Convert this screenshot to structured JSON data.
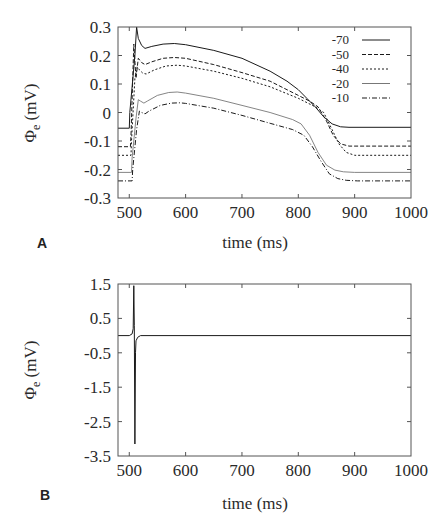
{
  "chart_data": [
    {
      "panel": "A",
      "type": "line",
      "title": "",
      "xlabel": "time (ms)",
      "ylabel": "Φe (mV)",
      "ylabel_main": "Φ",
      "ylabel_sub": "e",
      "ylabel_unit": " (mV)",
      "xlim": [
        480,
        1000
      ],
      "ylim": [
        -0.3,
        0.3
      ],
      "xticks": [
        500,
        600,
        700,
        800,
        900,
        1000
      ],
      "xtick_labels": [
        "500",
        "600",
        "700",
        "800",
        "900",
        "1000"
      ],
      "yticks": [
        0.3,
        0.2,
        0.1,
        0,
        -0.1,
        -0.2,
        -0.3
      ],
      "ytick_labels": [
        "0.3",
        "0.2",
        "0.1",
        "0",
        "-0.1",
        "-0.2",
        "-0.3"
      ],
      "grid": false,
      "legend_position": "upper right",
      "series": [
        {
          "name": "-70",
          "dash": "",
          "x": [
            480,
            500,
            501,
            510,
            513,
            516,
            522,
            528,
            540,
            560,
            580,
            600,
            650,
            700,
            750,
            780,
            800,
            815,
            830,
            845,
            860,
            875,
            890,
            1000
          ],
          "y": [
            -0.055,
            -0.055,
            0.0,
            0.2,
            0.3,
            0.26,
            0.235,
            0.225,
            0.232,
            0.24,
            0.242,
            0.238,
            0.218,
            0.19,
            0.145,
            0.11,
            0.08,
            0.05,
            0.02,
            -0.015,
            -0.04,
            -0.05,
            -0.052,
            -0.052
          ]
        },
        {
          "name": "-50",
          "dash": "4,2",
          "x": [
            480,
            502,
            503,
            508,
            512,
            516,
            522,
            528,
            540,
            560,
            580,
            600,
            650,
            700,
            750,
            800,
            820,
            835,
            850,
            862,
            875,
            890,
            1000
          ],
          "y": [
            -0.12,
            -0.12,
            -0.08,
            0.24,
            0.12,
            0.19,
            0.175,
            0.168,
            0.178,
            0.19,
            0.193,
            0.19,
            0.168,
            0.14,
            0.11,
            0.06,
            0.04,
            0.02,
            -0.03,
            -0.08,
            -0.11,
            -0.118,
            -0.118
          ]
        },
        {
          "name": "-40",
          "dash": "2,2",
          "x": [
            480,
            503,
            504,
            510,
            514,
            518,
            524,
            530,
            545,
            565,
            585,
            600,
            650,
            700,
            750,
            800,
            830,
            845,
            860,
            872,
            885,
            900,
            1000
          ],
          "y": [
            -0.15,
            -0.15,
            -0.1,
            0.12,
            0.16,
            0.15,
            0.138,
            0.135,
            0.15,
            0.163,
            0.166,
            0.163,
            0.145,
            0.12,
            0.09,
            0.05,
            0.02,
            0.0,
            -0.06,
            -0.11,
            -0.14,
            -0.15,
            -0.15
          ]
        },
        {
          "name": "-20",
          "dash": "",
          "thin": true,
          "x": [
            480,
            504,
            505,
            512,
            516,
            520,
            526,
            532,
            550,
            570,
            585,
            600,
            650,
            700,
            750,
            790,
            805,
            820,
            835,
            850,
            865,
            880,
            900,
            1000
          ],
          "y": [
            -0.21,
            -0.21,
            -0.16,
            -0.02,
            0.045,
            0.04,
            0.033,
            0.04,
            0.06,
            0.07,
            0.072,
            0.068,
            0.05,
            0.025,
            0.0,
            -0.025,
            -0.04,
            -0.08,
            -0.14,
            -0.185,
            -0.202,
            -0.208,
            -0.21,
            -0.21
          ]
        },
        {
          "name": "-10",
          "dash": "5,2,1,2",
          "x": [
            480,
            505,
            506,
            513,
            518,
            522,
            528,
            535,
            555,
            575,
            590,
            600,
            650,
            700,
            750,
            790,
            810,
            825,
            840,
            855,
            870,
            885,
            905,
            1000
          ],
          "y": [
            -0.24,
            -0.24,
            -0.2,
            -0.06,
            0.005,
            0.0,
            -0.005,
            0.005,
            0.025,
            0.033,
            0.034,
            0.032,
            0.015,
            -0.01,
            -0.038,
            -0.06,
            -0.08,
            -0.12,
            -0.17,
            -0.215,
            -0.232,
            -0.238,
            -0.24,
            -0.24
          ]
        }
      ]
    },
    {
      "panel": "B",
      "type": "line",
      "title": "",
      "xlabel": "time (ms)",
      "ylabel": "Φe (mV)",
      "ylabel_main": "Φ",
      "ylabel_sub": "e",
      "ylabel_unit": " (mV)",
      "xlim": [
        480,
        1000
      ],
      "ylim": [
        -3.5,
        1.5
      ],
      "xticks": [
        500,
        600,
        700,
        800,
        900,
        1000
      ],
      "xtick_labels": [
        "500",
        "600",
        "700",
        "800",
        "900",
        "1000"
      ],
      "yticks": [
        1.5,
        0.5,
        -0.5,
        -1.5,
        -2.5,
        -3.5
      ],
      "ytick_labels": [
        "1.5",
        "0.5",
        "-0.5",
        "-1.5",
        "-2.5",
        "-3.5"
      ],
      "grid": false,
      "legend_position": "none",
      "series": [
        {
          "name": "signal",
          "dash": "",
          "x": [
            480,
            500,
            505,
            507,
            508,
            509,
            510,
            511,
            512,
            515,
            520,
            1000
          ],
          "y": [
            0.0,
            0.0,
            0.05,
            0.2,
            1.45,
            0.3,
            -3.15,
            -0.5,
            -0.15,
            -0.05,
            0.0,
            0.0
          ]
        }
      ]
    }
  ],
  "panels": {
    "a_label": "A",
    "b_label": "B"
  },
  "colors": {
    "line": "#1a1a1a",
    "frame": "#555555",
    "text": "#2a2a2a"
  }
}
